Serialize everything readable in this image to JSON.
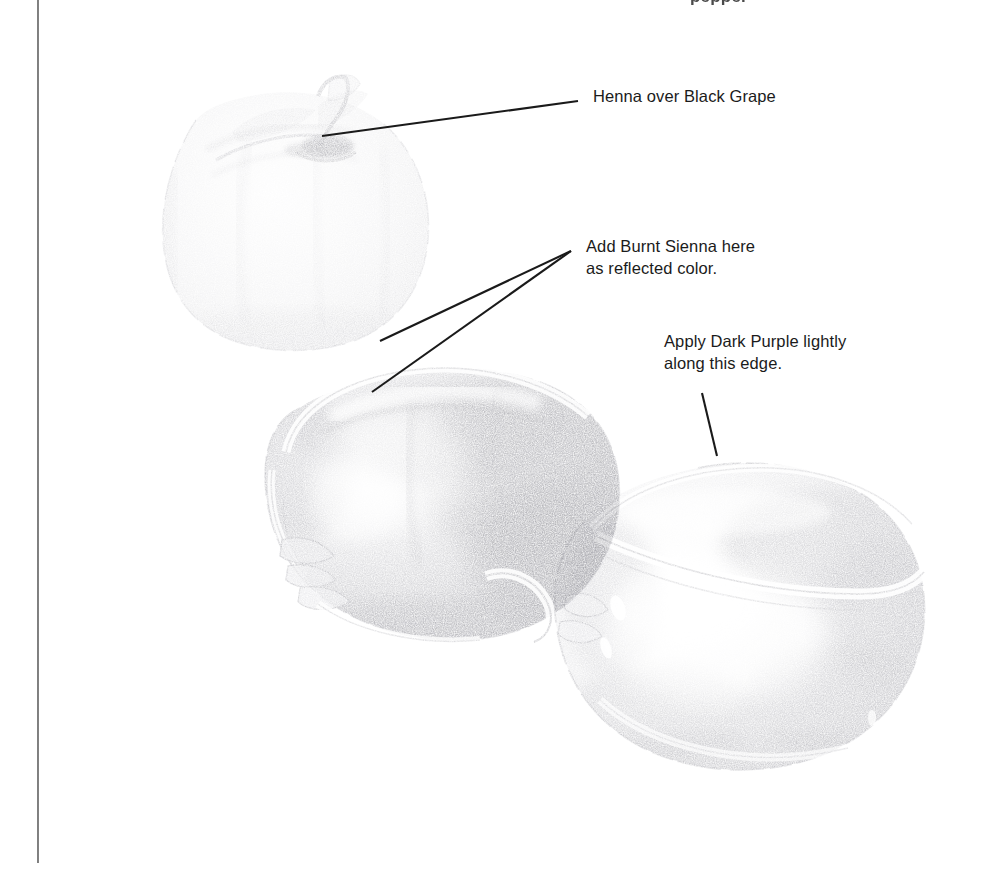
{
  "page": {
    "width": 982,
    "height": 880,
    "background_color": "#ffffff",
    "clipped_heading": "pepper",
    "margin_rule_color": "#7a7a7a"
  },
  "artwork": {
    "subject": "three bell peppers rendered in graphite / colored pencil",
    "medium": "pencil drawing",
    "paper_color": "#ffffff",
    "graphite_color": "#6e6e72",
    "items": [
      {
        "name": "pepper-top-left",
        "note": "palest pepper, stem upright, seen from above-left"
      },
      {
        "name": "pepper-center",
        "note": "darkest, most fully shaded pepper, lying on its side"
      },
      {
        "name": "pepper-right",
        "note": "mid-value pepper with strong highlights, lying to the right"
      }
    ]
  },
  "annotations": [
    {
      "id": "henna",
      "text": "Henna over Black Grape",
      "leaders": [
        {
          "x1": 578,
          "y1": 101,
          "x2": 322,
          "y2": 136
        }
      ]
    },
    {
      "id": "sienna",
      "text": "Add Burnt Sienna here\nas reflected color.",
      "leaders": [
        {
          "x1": 571,
          "y1": 251,
          "x2": 380,
          "y2": 341
        },
        {
          "x1": 571,
          "y1": 251,
          "x2": 372,
          "y2": 392
        }
      ]
    },
    {
      "id": "purple",
      "text": "Apply Dark Purple lightly\nalong this edge.",
      "leaders": [
        {
          "x1": 702,
          "y1": 393,
          "x2": 717,
          "y2": 456
        }
      ]
    }
  ]
}
